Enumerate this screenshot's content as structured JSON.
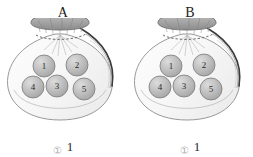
{
  "figure": {
    "name": "two-bags-with-numbered-balls",
    "background_color": "#ffffff"
  },
  "palette": {
    "bag_outline": "#8d8d8d",
    "bag_fill": "#fbfbfb",
    "bag_shade": "#f1f1f1",
    "bag_shadow_line": "#3a3a3a",
    "drawstring_top_fill": "#a9a9a9",
    "drawstring_top_outline": "#6f6f6f",
    "ball_fill": "#b9b9b9",
    "ball_highlight": "#d8d8d8",
    "ball_outline": "#7a7a7a",
    "ball_text": "#2b2b2b",
    "label_text": "#1c1c1c",
    "caption_marker": "#aeaeae",
    "caption_value": "#2a2a2a"
  },
  "bags": [
    {
      "id": "bag-a",
      "label": "A",
      "balls": [
        {
          "number": "1",
          "cx": 44,
          "cy": 48,
          "r": 11
        },
        {
          "number": "2",
          "cx": 77,
          "cy": 47,
          "r": 11
        },
        {
          "number": "4",
          "cx": 33,
          "cy": 69,
          "r": 11
        },
        {
          "number": "3",
          "cx": 57,
          "cy": 68,
          "r": 11
        },
        {
          "number": "5",
          "cx": 84,
          "cy": 71,
          "r": 11
        }
      ],
      "caption": {
        "marker": "①",
        "value": "1"
      }
    },
    {
      "id": "bag-b",
      "label": "B",
      "balls": [
        {
          "number": "1",
          "cx": 44,
          "cy": 48,
          "r": 11
        },
        {
          "number": "2",
          "cx": 77,
          "cy": 47,
          "r": 11
        },
        {
          "number": "4",
          "cx": 33,
          "cy": 69,
          "r": 11
        },
        {
          "number": "3",
          "cx": 57,
          "cy": 68,
          "r": 11
        },
        {
          "number": "5",
          "cx": 84,
          "cy": 71,
          "r": 11
        }
      ],
      "caption": {
        "marker": "①",
        "value": "1"
      }
    }
  ]
}
